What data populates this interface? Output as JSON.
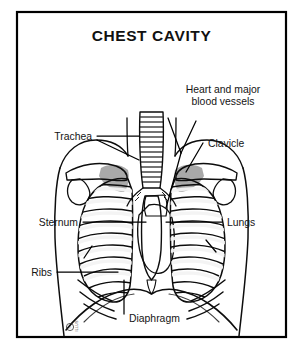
{
  "figure": {
    "title": "CHEST CAVITY",
    "background_color": "#ffffff",
    "ink_color": "#0d0d0d",
    "border_color": "#000000",
    "lung_shade_color": "#8d8d8d",
    "bone_shade_color": "#d6d6d6",
    "rib_band_color": "#f2f2f2"
  },
  "labels": {
    "heart": {
      "line1": "Heart and major",
      "line2": "blood vessels"
    },
    "trachea": "Trachea",
    "clavicle": "Clavicle",
    "sternum": "Sternum",
    "lungs": "Lungs",
    "ribs": "Ribs",
    "diaphragm": "Diaphragm"
  },
  "signature": {
    "mark": "©",
    "text": "ILLUS"
  }
}
